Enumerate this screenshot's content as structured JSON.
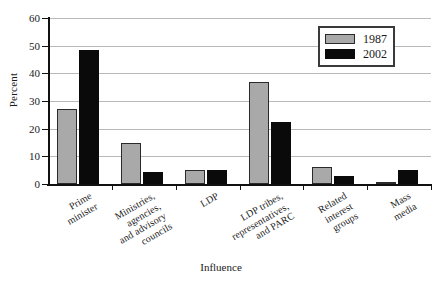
{
  "chart_data": {
    "type": "bar",
    "title": "",
    "xlabel": "Influence",
    "ylabel": "Percent",
    "ylim": [
      0,
      60
    ],
    "ytick_labels": [
      "0",
      "10",
      "20",
      "30",
      "40",
      "50",
      "60"
    ],
    "ytick_values": [
      0,
      10,
      20,
      30,
      40,
      50,
      60
    ],
    "grid": true,
    "legend_position": "top-right",
    "categories": [
      "Prime\nminister",
      "Ministries,\nagencies,\nand advisory\ncouncils",
      "LDP",
      "LDP tribes,\nrepresentatives,\nand PARC",
      "Related\ninterest\ngroups",
      "Mass\nmedia"
    ],
    "series": [
      {
        "name": "1987",
        "color": "#a9a9a9",
        "values": [
          27,
          15,
          5,
          37,
          6,
          0.5
        ]
      },
      {
        "name": "2002",
        "color": "#0a0a0a",
        "values": [
          48.5,
          4.5,
          5,
          22.5,
          3,
          5
        ]
      }
    ]
  },
  "legend": {
    "entries": [
      {
        "label": "1987"
      },
      {
        "label": "2002"
      }
    ]
  }
}
